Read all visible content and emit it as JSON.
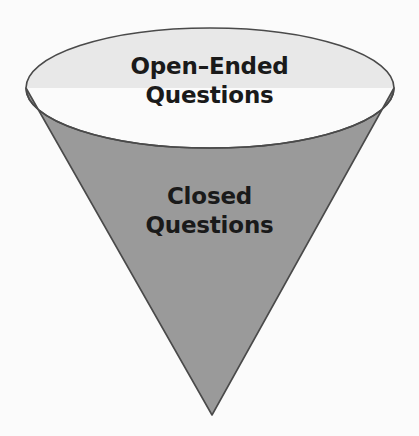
{
  "diagram": {
    "type": "inverted-cone-funnel",
    "title_present": false,
    "background_color": "#fbfbfb",
    "outline_color": "#4a4a4a",
    "text_color": "#1a1a1a",
    "sections": [
      {
        "id": "open-ended",
        "name": "open-ended-section",
        "label_lines": [
          "Open–Ended",
          "Questions"
        ],
        "line1": "Open–Ended",
        "line2": "Questions",
        "fill_color": "#e8e8e8",
        "shape": "ellipse-top-rim",
        "position": "top"
      },
      {
        "id": "closed",
        "name": "closed-section",
        "label_lines": [
          "Closed",
          "Questions"
        ],
        "line1": "Closed",
        "line2": "Questions",
        "fill_color": "#9a9a9a",
        "shape": "cone-body",
        "position": "bottom"
      }
    ],
    "geometry": {
      "ellipse_center_x": 210,
      "ellipse_center_y": 88,
      "ellipse_rx": 184,
      "ellipse_ry": 60,
      "apex_x": 212,
      "apex_y": 415
    }
  }
}
